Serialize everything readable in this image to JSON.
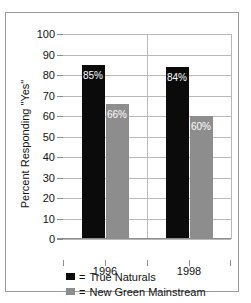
{
  "chart_data": {
    "type": "bar",
    "title": "",
    "xlabel": "",
    "ylabel": "Percent Responding \"Yes\"",
    "categories": [
      "1996",
      "1998"
    ],
    "ylim": [
      0,
      100
    ],
    "yticks": [
      0,
      10,
      20,
      30,
      40,
      50,
      60,
      70,
      80,
      90,
      100
    ],
    "ytick_labels": [
      "0",
      "10",
      "20",
      "30",
      "40",
      "50",
      "60",
      "70",
      "80",
      "90",
      "100"
    ],
    "grid": true,
    "legend_position": "bottom-center",
    "series": [
      {
        "name": "True Naturals",
        "color": "#0b0b0b",
        "values": [
          85,
          84
        ],
        "data_labels": [
          "85%",
          "84%"
        ]
      },
      {
        "name": "New Green Mainstream",
        "color": "#8d8d8d",
        "values": [
          66,
          60
        ],
        "data_labels": [
          "66%",
          "60%"
        ]
      }
    ]
  },
  "legend": {
    "equals": "=",
    "items": [
      {
        "label": "True Naturals",
        "swatch": "legend-swatch-true-naturals"
      },
      {
        "label": "New Green Mainstream",
        "swatch": "legend-swatch-new-green-mainstream"
      }
    ]
  }
}
